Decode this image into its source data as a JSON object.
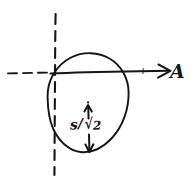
{
  "figure": {
    "kind": "hand-drawn-geometry-sketch",
    "background_color": "#ffffff",
    "ink_color": "#151515",
    "axis": {
      "label": "A",
      "direction": "right",
      "line_y": 72,
      "dashed_from_x": 8,
      "dashed_to_x": 52,
      "solid_from_x": 52,
      "arrow_tip_x": 170
    },
    "vertical_dashed_line": {
      "x": 55,
      "from_y": 14,
      "to_y": 175
    },
    "circle": {
      "center_x": 88,
      "center_y": 102,
      "radius": 41
    },
    "dimension_arrow": {
      "x": 88,
      "top_y": 105,
      "bottom_y": 152,
      "heads": "both",
      "label_parts": {
        "numerator": "s",
        "slash": "/",
        "radical": "√",
        "radicand": "2"
      },
      "label_plain": "s/√2"
    }
  }
}
